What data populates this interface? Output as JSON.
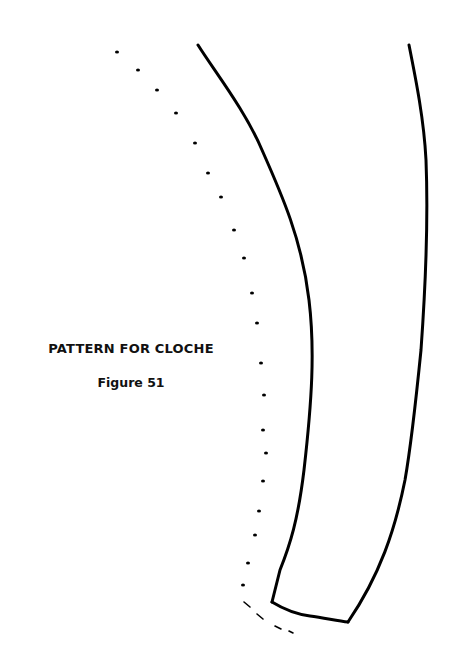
{
  "caption": {
    "title": "PATTERN FOR CLOCHE",
    "figure": "Figure 51"
  },
  "drawing": {
    "stroke_color": "#000000",
    "background": "#ffffff",
    "left_outline": "M198,45 C215,72 245,110 262,150 C282,195 302,240 309,300 C315,350 312,400 304,470 C298,520 290,545 280,570 L272,602",
    "bottom_edge": "M272,602 C285,610 295,614 310,616 C325,618 338,621 348,622",
    "right_outline": "M409,45 C416,80 424,120 426,160 C428,210 426,280 421,350 C416,400 412,440 405,480 C395,530 380,575 348,622",
    "seam_dots": [
      [
        117,
        52
      ],
      [
        138,
        70
      ],
      [
        157,
        90
      ],
      [
        176,
        113
      ],
      [
        195,
        143
      ],
      [
        208,
        173
      ],
      [
        221,
        197
      ],
      [
        234,
        230
      ],
      [
        244,
        258
      ],
      [
        252,
        293
      ],
      [
        257,
        323
      ],
      [
        261,
        363
      ],
      [
        264,
        395
      ],
      [
        263,
        430
      ],
      [
        266,
        453
      ],
      [
        263,
        481
      ],
      [
        259,
        511
      ],
      [
        255,
        535
      ],
      [
        248,
        563
      ],
      [
        243,
        585
      ]
    ],
    "seam_dashes": [
      [
        [
          244,
          602
        ],
        [
          250,
          607
        ]
      ],
      [
        [
          257,
          614
        ],
        [
          263,
          619
        ]
      ],
      [
        [
          275,
          626
        ],
        [
          281,
          629
        ]
      ],
      [
        [
          289,
          631
        ],
        [
          293,
          633
        ]
      ]
    ]
  }
}
